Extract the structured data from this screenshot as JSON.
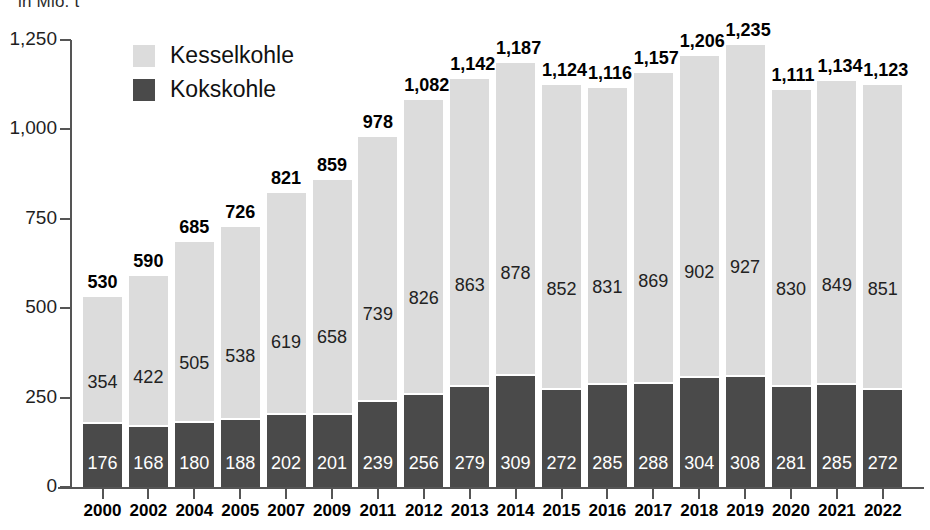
{
  "unit_note": "in Mio. t",
  "legend": {
    "position": "top-left-inside",
    "items": [
      {
        "label": "Kesselkohle",
        "color": "#dcdcdc",
        "swatch_name": "legend-swatch-kesselkohle"
      },
      {
        "label": "Kokskohle",
        "color": "#4a4a4a",
        "swatch_name": "legend-swatch-kokskohle"
      }
    ]
  },
  "chart_data": {
    "type": "bar",
    "subtype": "stacked-vertical",
    "title": "",
    "subtitle": "in Mio. t",
    "xlabel": "",
    "ylabel": "",
    "ylim": [
      0,
      1250
    ],
    "grid": false,
    "y_ticks": [
      0,
      250,
      500,
      750,
      1000,
      1250
    ],
    "y_tick_labels": [
      "0",
      "250",
      "500",
      "750",
      "1,000",
      "1,250"
    ],
    "categories": [
      "2000",
      "2002",
      "2004",
      "2005",
      "2007",
      "2009",
      "2011",
      "2012",
      "2013",
      "2014",
      "2015",
      "2016",
      "2017",
      "2018",
      "2019",
      "2020",
      "2021",
      "2022"
    ],
    "series": [
      {
        "name": "Kesselkohle",
        "color": "#dcdcdc",
        "values": [
          354,
          422,
          505,
          538,
          619,
          658,
          739,
          826,
          863,
          878,
          852,
          831,
          869,
          902,
          927,
          830,
          849,
          851
        ]
      },
      {
        "name": "Kokskohle",
        "color": "#4a4a4a",
        "values": [
          176,
          168,
          180,
          188,
          202,
          201,
          239,
          256,
          279,
          309,
          272,
          285,
          288,
          304,
          308,
          281,
          285,
          272
        ]
      }
    ],
    "totals": [
      530,
      590,
      685,
      726,
      821,
      859,
      978,
      1082,
      1142,
      1187,
      1124,
      1116,
      1157,
      1206,
      1235,
      1111,
      1134,
      1123
    ],
    "total_labels": [
      "530",
      "590",
      "685",
      "726",
      "821",
      "859",
      "978",
      "1,082",
      "1,142",
      "1,187",
      "1,124",
      "1,116",
      "1,157",
      "1,206",
      "1,235",
      "1,111",
      "1,134",
      "1,123"
    ],
    "kesselkohle_labels": [
      "354",
      "422",
      "505",
      "538",
      "619",
      "658",
      "739",
      "826",
      "863",
      "878",
      "852",
      "831",
      "869",
      "902",
      "927",
      "830",
      "849",
      "851"
    ],
    "kokskohle_labels": [
      "176",
      "168",
      "180",
      "188",
      "202",
      "201",
      "239",
      "256",
      "279",
      "309",
      "272",
      "285",
      "288",
      "304",
      "308",
      "281",
      "285",
      "272"
    ]
  }
}
